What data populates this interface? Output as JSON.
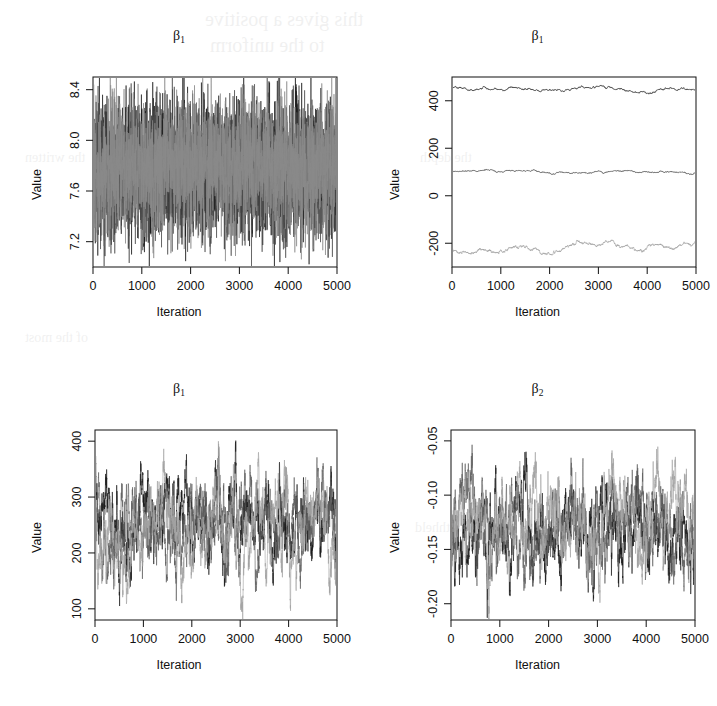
{
  "figure": {
    "kind": "mcmc-trace-panel-grid",
    "rows": 2,
    "columns": 2,
    "background_ghost_text": [
      "this gives a positive",
      "to the uniform",
      "the written",
      "of the most",
      "it withheld",
      "the depth"
    ]
  },
  "chart_data": [
    {
      "id": "panel-top-left",
      "type": "line",
      "title": "β1",
      "title_base": "β",
      "title_sub": "1",
      "xlabel": "Iteration",
      "ylabel": "Value",
      "xlim": [
        0,
        5000
      ],
      "ylim": [
        7.0,
        8.5
      ],
      "xticks": [
        0,
        1000,
        2000,
        3000,
        4000,
        5000
      ],
      "xtick_labels": [
        "0",
        "1000",
        "2000",
        "3000",
        "4000",
        "5000"
      ],
      "yticks": [
        7.2,
        7.6,
        8.0,
        8.4
      ],
      "ytick_labels": [
        "7.2",
        "7.6",
        "8.0",
        "8.4"
      ],
      "grid": false,
      "legend": "none",
      "n_iterations": 5000,
      "series": [
        {
          "name": "chain-1",
          "color": "#1c1c1c",
          "mean": 7.78,
          "sd": 0.26,
          "rho": 0.04,
          "drift": 0.0
        },
        {
          "name": "chain-2",
          "color": "#4d4d4d",
          "mean": 7.76,
          "sd": 0.25,
          "rho": 0.04,
          "drift": 0.0
        },
        {
          "name": "chain-3",
          "color": "#8a8a8a",
          "mean": 7.8,
          "sd": 0.25,
          "rho": 0.04,
          "drift": 0.0
        }
      ],
      "notes": "three well-mixed chains overlap into a dense grey band between ~7.45 and ~8.05"
    },
    {
      "id": "panel-top-right",
      "type": "line",
      "title": "β1",
      "title_base": "β",
      "title_sub": "1",
      "xlabel": "Iteration",
      "ylabel": "Value",
      "xlim": [
        0,
        5000
      ],
      "ylim": [
        -300,
        500
      ],
      "xticks": [
        0,
        1000,
        2000,
        3000,
        4000,
        5000
      ],
      "xtick_labels": [
        "0",
        "1000",
        "2000",
        "3000",
        "4000",
        "5000"
      ],
      "yticks": [
        -200,
        0,
        200,
        400
      ],
      "ytick_labels": [
        "-200",
        "0",
        "200",
        "400"
      ],
      "grid": false,
      "legend": "none",
      "n_iterations": 5000,
      "series": [
        {
          "name": "chain-1",
          "color": "#1c1c1c",
          "mean": 452,
          "sd": 6,
          "rho": 0.995,
          "drift": -8
        },
        {
          "name": "chain-2",
          "color": "#2c2c2c",
          "mean": 102,
          "sd": 4,
          "rho": 0.995,
          "drift": -4
        },
        {
          "name": "chain-3",
          "color": "#9a9a9a",
          "mean": -232,
          "sd": 12,
          "rho": 0.997,
          "drift": 28
        }
      ],
      "notes": "three chains stuck at separate levels (~450, ~100, ~-230): no mixing"
    },
    {
      "id": "panel-bottom-left",
      "type": "line",
      "title": "β1",
      "title_base": "β",
      "title_sub": "1",
      "xlabel": "Iteration",
      "ylabel": "Value",
      "xlim": [
        0,
        5000
      ],
      "ylim": [
        80,
        420
      ],
      "xticks": [
        0,
        1000,
        2000,
        3000,
        4000,
        5000
      ],
      "xtick_labels": [
        "0",
        "1000",
        "2000",
        "3000",
        "4000",
        "5000"
      ],
      "yticks": [
        100,
        200,
        300,
        400
      ],
      "ytick_labels": [
        "100",
        "200",
        "300",
        "400"
      ],
      "grid": false,
      "legend": "none",
      "n_iterations": 5000,
      "series": [
        {
          "name": "chain-1",
          "color": "#1a1a1a",
          "mean": 258,
          "sd": 48,
          "rho": 0.975,
          "drift": 0
        },
        {
          "name": "chain-2",
          "color": "#5e5e5e",
          "mean": 248,
          "sd": 44,
          "rho": 0.975,
          "drift": 0
        },
        {
          "name": "chain-3",
          "color": "#a2a2a2",
          "mean": 243,
          "sd": 50,
          "rho": 0.978,
          "drift": 0
        }
      ],
      "notes": "slow-mixing chains wandering between ~100 and ~410, strong autocorrelation"
    },
    {
      "id": "panel-bottom-right",
      "type": "line",
      "title": "β2",
      "title_base": "β",
      "title_sub": "2",
      "xlabel": "Iteration",
      "ylabel": "Value",
      "xlim": [
        0,
        5000
      ],
      "ylim": [
        -0.215,
        -0.04
      ],
      "xticks": [
        0,
        1000,
        2000,
        3000,
        4000,
        5000
      ],
      "xtick_labels": [
        "0",
        "1000",
        "2000",
        "3000",
        "4000",
        "5000"
      ],
      "yticks": [
        -0.2,
        -0.15,
        -0.1,
        -0.05
      ],
      "ytick_labels": [
        "-0.20",
        "-0.15",
        "-0.10",
        "-0.05"
      ],
      "grid": false,
      "legend": "none",
      "n_iterations": 5000,
      "series": [
        {
          "name": "chain-1",
          "color": "#1a1a1a",
          "mean": -0.132,
          "sd": 0.024,
          "rho": 0.975,
          "drift": 0
        },
        {
          "name": "chain-2",
          "color": "#5e5e5e",
          "mean": -0.127,
          "sd": 0.023,
          "rho": 0.975,
          "drift": 0
        },
        {
          "name": "chain-3",
          "color": "#a2a2a2",
          "mean": -0.124,
          "sd": 0.025,
          "rho": 0.978,
          "drift": 0
        }
      ],
      "notes": "slow-mixing chains wandering between ~-0.205 and ~-0.048"
    }
  ]
}
